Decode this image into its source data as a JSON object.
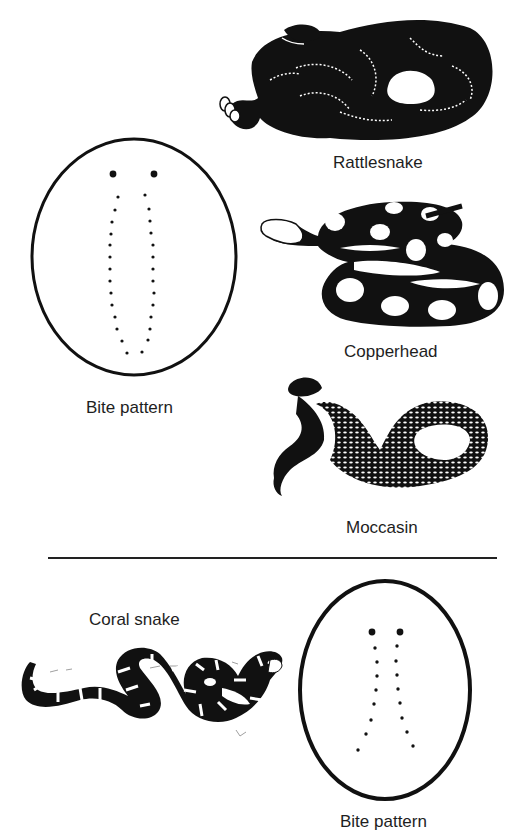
{
  "figure": {
    "top_section": {
      "bite_pattern_label": "Bite pattern",
      "bite_pattern_type": "fang marks with two rows of teeth marks (pit viper)",
      "snakes": [
        {
          "name": "Rattlesnake",
          "icon": "rattlesnake-illustration"
        },
        {
          "name": "Copperhead",
          "icon": "copperhead-illustration"
        },
        {
          "name": "Moccasin",
          "icon": "moccasin-illustration"
        }
      ]
    },
    "bottom_section": {
      "snake": {
        "name": "Coral snake",
        "icon": "coral-snake-illustration"
      },
      "bite_pattern_label": "Bite pattern",
      "bite_pattern_type": "two fang marks followed by diverging tooth marks (coral snake)"
    },
    "colors": {
      "ink": "#111111",
      "paper": "#ffffff"
    }
  }
}
